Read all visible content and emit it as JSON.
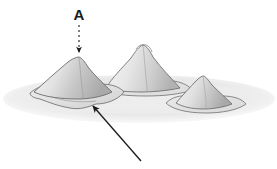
{
  "figure": {
    "type": "grayscale-line-illustration",
    "background_color": "#ffffff",
    "caption_label": "A"
  },
  "labels": [
    {
      "id": "label-a",
      "text": "A",
      "x": 79,
      "y": 18,
      "color": "#1a1a1a",
      "bold": true
    }
  ],
  "annotations": {
    "dashed_arrow": {
      "name": "dashed-callout-arrow",
      "style": "dashed",
      "color": "#1a1a1a",
      "from_x": 79,
      "from_y": 24,
      "to_x": 79,
      "to_y": 54,
      "points_to": "left-peak-summit",
      "dash_pattern": "2 3",
      "stroke_width": 1.1
    },
    "solid_arrow": {
      "name": "solid-pointer-arrow",
      "style": "solid",
      "color": "#1a1a1a",
      "from_x": 141,
      "from_y": 161,
      "to_x": 91,
      "to_y": 104,
      "points_to": "left-peak-base-skirt",
      "stroke_width": 1.3
    }
  },
  "ground": {
    "name": "base-plane",
    "fill_color": "#ececec",
    "shadow_color": "#e2e2e2",
    "outline_color": "#9a9a9a",
    "waterline_color": "#6e6e6e"
  },
  "peaks": [
    {
      "id": "left-peak",
      "name": "left-peak",
      "apex_x": 79,
      "apex_y": 57,
      "base_y": 108,
      "height_px": 51,
      "light_fill": "#e4e4e4",
      "shade_fill": "#b4b4b4",
      "outline_color": "#6b6b6b",
      "rank": "medium"
    },
    {
      "id": "middle-peak",
      "name": "middle-peak",
      "apex_x": 143,
      "apex_y": 45,
      "base_y": 92,
      "height_px": 47,
      "light_fill": "#ededed",
      "shade_fill": "#bdbdbd",
      "outline_color": "#6b6b6b",
      "rank": "tallest"
    },
    {
      "id": "right-peak",
      "name": "right-peak",
      "apex_x": 203,
      "apex_y": 76,
      "base_y": 110,
      "height_px": 34,
      "light_fill": "#e8e8e8",
      "shade_fill": "#b9b9b9",
      "outline_color": "#6b6b6b",
      "rank": "smallest"
    }
  ],
  "palette": {
    "ink": "#1a1a1a",
    "outline": "#6b6b6b",
    "light_gray": "#e8e8e8",
    "mid_gray": "#b8b8b8",
    "pale_gray": "#f0f0f0",
    "background": "#ffffff"
  }
}
